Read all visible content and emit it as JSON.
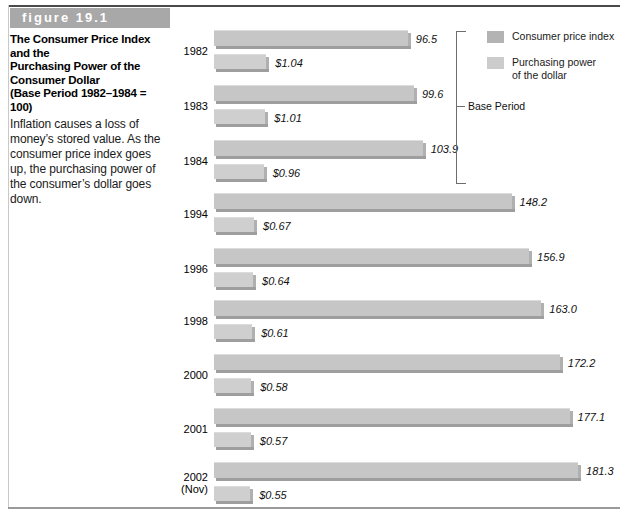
{
  "figure": {
    "banner_label": "figure 19.1",
    "title_lines": [
      "The Consumer Price Index and the",
      "Purchasing Power of the",
      "Consumer Dollar",
      "(Base Period 1982–1984 = 100)"
    ],
    "body_text": "Inflation causes a loss of money’s stored value. As the consumer price index goes up, the purchasing power of the consumer’s dollar goes down."
  },
  "legend": {
    "items": [
      {
        "label": "Consumer price index",
        "color": "#b3b3b3"
      },
      {
        "label": "Purchasing power\nof the dollar",
        "color": "#cccccc"
      }
    ]
  },
  "annotations": {
    "base_period_label": "Base Period"
  },
  "chart_data": {
    "type": "bar",
    "title": "The Consumer Price Index and the Purchasing Power of the Consumer Dollar (Base Period 1982–1984 = 100)",
    "orientation": "horizontal",
    "xlabel": "",
    "ylabel": "",
    "grid": false,
    "legend_position": "top-right",
    "categories": [
      "1982",
      "1983",
      "1984",
      "1994",
      "1996",
      "1998",
      "2000",
      "2001",
      "2002 (Nov)"
    ],
    "category_labels": [
      {
        "line1": "1982",
        "line2": ""
      },
      {
        "line1": "1983",
        "line2": ""
      },
      {
        "line1": "1984",
        "line2": ""
      },
      {
        "line1": "1994",
        "line2": ""
      },
      {
        "line1": "1996",
        "line2": ""
      },
      {
        "line1": "1998",
        "line2": ""
      },
      {
        "line1": "2000",
        "line2": ""
      },
      {
        "line1": "2001",
        "line2": ""
      },
      {
        "line1": "2002",
        "line2": "(Nov)"
      }
    ],
    "series": [
      {
        "name": "Consumer price index",
        "color": "#c6c6c6",
        "values": [
          96.5,
          99.6,
          103.9,
          148.2,
          156.9,
          163.0,
          172.2,
          177.1,
          181.3
        ],
        "labels": [
          "96.5",
          "99.6",
          "103.9",
          "148.2",
          "156.9",
          "163.0",
          "172.2",
          "177.1",
          "181.3"
        ]
      },
      {
        "name": "Purchasing power of the dollar",
        "color": "#cfcfcf",
        "values": [
          1.04,
          1.01,
          0.96,
          0.67,
          0.64,
          0.61,
          0.58,
          0.57,
          0.55
        ],
        "labels": [
          "$1.04",
          "$1.01",
          "$0.96",
          "$0.67",
          "$0.64",
          "$0.61",
          "$0.58",
          "$0.57",
          "$0.55"
        ]
      }
    ],
    "base_period_categories": [
      "1982",
      "1983",
      "1984"
    ],
    "cpi_axis_max": 200,
    "dollar_axis_max": 1.2
  },
  "layout": {
    "bar_origin_x": 214,
    "cpi_px_per_unit": 2.008,
    "row_tops": [
      30,
      85,
      140,
      193,
      248,
      300,
      354,
      408,
      462
    ],
    "dollar_base_px": 18,
    "dollar_px_per_dollar": 33.0
  }
}
